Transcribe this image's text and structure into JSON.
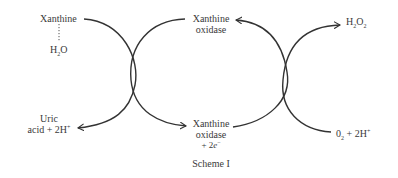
{
  "diagram": {
    "type": "coupled-reaction-scheme",
    "caption": "Scheme I",
    "colors": {
      "line": "#333333",
      "text": "#3a3a3a",
      "background": "#ffffff"
    },
    "cycles": [
      {
        "name": "left-cycle",
        "reactant": {
          "text": "Xanthine"
        },
        "cofactor": {
          "main": "H",
          "sub": "2",
          "tail": "O"
        },
        "product": {
          "line1": "Uric",
          "line2_pre": "acid + 2H",
          "line2_sup": "+"
        }
      },
      {
        "name": "middle-cycle",
        "top": {
          "line1": "Xanthine",
          "line2": "oxidase"
        },
        "bottom": {
          "line1": "Xanthine",
          "line2": "oxidase",
          "line3_pre": "+ 2",
          "line3_e": "e",
          "line3_sup": "−"
        }
      },
      {
        "name": "right-cycle",
        "product": {
          "main": "H",
          "sub1": "2",
          "mid": "O",
          "sub2": "2"
        },
        "reactant": {
          "main": "0",
          "sub": "2",
          "tail": " + 2H",
          "sup": "+"
        }
      }
    ]
  }
}
